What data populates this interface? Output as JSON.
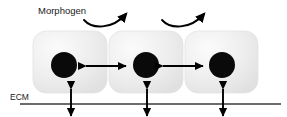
{
  "figure": {
    "title_label": "Morphogen",
    "ecm_label": "ECM",
    "canvas": {
      "width": 287,
      "height": 117
    },
    "colors": {
      "background": "#ffffff",
      "cell_fill_light": "#f2f2f2",
      "cell_fill_mid": "#e8e8e8",
      "cell_fill_shadow": "#d9d9d9",
      "cell_border": "#e0e0e0",
      "nucleus": "#0a0a0a",
      "arrow": "#000000",
      "ecm_line": "#3a3a3a",
      "text": "#1a1a1a"
    }
  },
  "cells": [
    {
      "name": "cell-left",
      "x": 33,
      "y": 31,
      "width": 74,
      "height": 62,
      "corner_radius": 13,
      "nucleus_cx": 64,
      "nucleus_cy": 65,
      "nucleus_r": 13
    },
    {
      "name": "cell-middle",
      "x": 109,
      "y": 31,
      "width": 74,
      "height": 62,
      "corner_radius": 13,
      "nucleus_cx": 146,
      "nucleus_cy": 65,
      "nucleus_r": 13
    },
    {
      "name": "cell-right",
      "x": 185,
      "y": 31,
      "width": 73,
      "height": 62,
      "corner_radius": 13,
      "nucleus_cx": 222,
      "nucleus_cy": 65,
      "nucleus_r": 13
    }
  ],
  "cell_cell_arrows": [
    {
      "name": "cell-cell-arrow-left",
      "x1": 86,
      "x2": 126,
      "y": 66
    },
    {
      "name": "cell-cell-arrow-right",
      "x1": 163,
      "x2": 203,
      "y": 66
    }
  ],
  "morphogen_arcs": [
    {
      "name": "morphogen-arc-left",
      "path": "M 84 20 C 92 29, 112 30, 126 14"
    },
    {
      "name": "morphogen-arc-right",
      "path": "M 162 20 C 170 29, 190 30, 204 14"
    }
  ],
  "ecm": {
    "line_x1": 20,
    "line_x2": 281,
    "line_y": 104,
    "label_x": 10,
    "label_y": 100
  },
  "cell_ecm_arrows": [
    {
      "name": "cell-ecm-arrow-left",
      "x": 71,
      "y_top": 89,
      "y_bottom": 116
    },
    {
      "name": "cell-ecm-arrow-middle",
      "x": 147,
      "y_top": 89,
      "y_bottom": 116
    },
    {
      "name": "cell-ecm-arrow-right",
      "x": 223,
      "y_top": 89,
      "y_bottom": 116
    }
  ]
}
